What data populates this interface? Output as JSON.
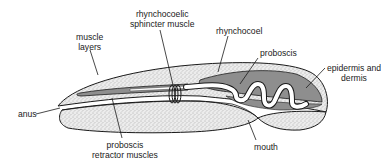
{
  "diagram": {
    "labels": {
      "muscle_layers": [
        "muscle",
        "layers"
      ],
      "sphincter": [
        "rhynchocoelic",
        "sphincter muscle"
      ],
      "rhynchocoel": "rhynchocoel",
      "proboscis": "proboscis",
      "epidermis": [
        "epidermis and",
        "dermis"
      ],
      "anus": "anus",
      "retractor": [
        "proboscis",
        "retractor muscles"
      ],
      "mouth": "mouth"
    },
    "colors": {
      "outline": "#1a1a1a",
      "stipple_bg": "#ececec",
      "stipple_dot": "#6a6a6a",
      "rhynchocoel_fill": "#8e8e8e",
      "proboscis_fill": "#ffffff",
      "background": "#ffffff"
    }
  }
}
